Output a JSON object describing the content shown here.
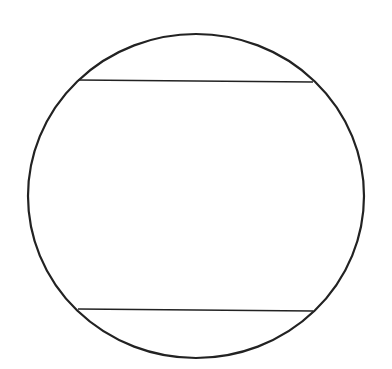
{
  "diagram": {
    "type": "circle-with-parallel-chords",
    "canvas": {
      "width": 392,
      "height": 369,
      "background": "#ffffff"
    },
    "stroke_color": "#222222",
    "circle": {
      "cx": 196,
      "cy": 196,
      "rx": 168,
      "ry": 162,
      "stroke_width": 2.2
    },
    "chords": [
      {
        "name": "top-chord",
        "x1": 78,
        "y1": 80,
        "x2": 313,
        "y2": 82,
        "stroke_width": 1.3
      },
      {
        "name": "bottom-chord",
        "x1": 78,
        "y1": 309,
        "x2": 313,
        "y2": 311,
        "stroke_width": 1.3
      }
    ]
  }
}
